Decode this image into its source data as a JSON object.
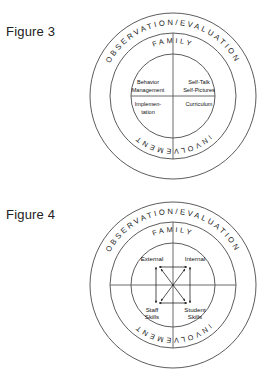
{
  "page": {
    "background": "#ffffff",
    "line_color": "#4a4a4a",
    "text_color": "#1a1a1a"
  },
  "figures": [
    {
      "caption": "Figure 3",
      "rings": {
        "outer_label": "OBSERVATION/EVALUATION",
        "middle_label_top": "FAMILY",
        "middle_label_bottom": "INVOLVEMENT"
      },
      "quadrants": [
        {
          "position": "top-left",
          "line1": "Behavior",
          "line2": "Management"
        },
        {
          "position": "top-right",
          "line1": "Self-Talk",
          "line2": "Self-Pictures"
        },
        {
          "position": "bottom-left",
          "line1": "Implemen-",
          "line2": "tation"
        },
        {
          "position": "bottom-right",
          "line1": "Curriculum",
          "line2": ""
        }
      ],
      "has_arrows": false
    },
    {
      "caption": "Figure 4",
      "rings": {
        "outer_label": "OBSERVATION/EVALUATION",
        "middle_label_top": "FAMILY",
        "middle_label_bottom": "INVOLVEMENT"
      },
      "quadrants": [
        {
          "position": "top-left",
          "line1": "External",
          "line2": ""
        },
        {
          "position": "top-right",
          "line1": "Internal",
          "line2": ""
        },
        {
          "position": "bottom-left",
          "line1": "Staff",
          "line2": "Skills"
        },
        {
          "position": "bottom-right",
          "line1": "Student",
          "line2": "Skills"
        }
      ],
      "has_arrows": true
    }
  ]
}
